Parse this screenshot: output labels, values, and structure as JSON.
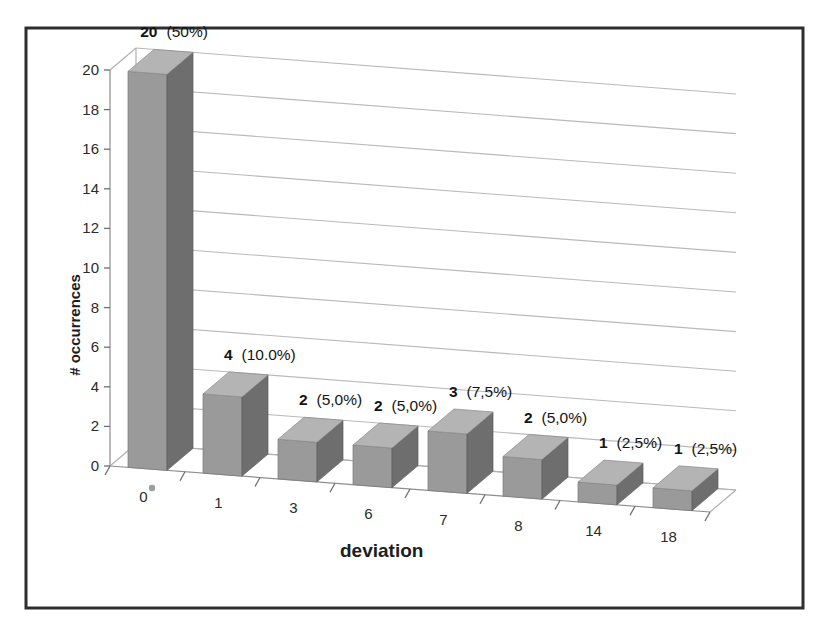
{
  "chart_data": {
    "type": "bar",
    "title": "",
    "subtitle": "",
    "xlabel": "deviation",
    "ylabel": "# occurrences",
    "categories": [
      "0",
      "1",
      "3",
      "6",
      "7",
      "8",
      "14",
      "18"
    ],
    "values": [
      20,
      4,
      2,
      2,
      3,
      2,
      1,
      1
    ],
    "data_labels": [
      "20  (50%)",
      "4 (10.0%)",
      "2 (5,0%)",
      "2 (5,0%)",
      "3 (7,5%)",
      "2 (5,0%)",
      "1 (2,5%)",
      "1 (2,5%)"
    ],
    "label_values": [
      "20",
      "4",
      "2",
      "2",
      "3",
      "2",
      "1",
      "1"
    ],
    "label_percents": [
      "(50%)",
      "(10.0%)",
      "(5,0%)",
      "(5,0%)",
      "(7,5%)",
      "(5,0%)",
      "(2,5%)",
      "(2,5%)"
    ],
    "percent_values": [
      50.0,
      10.0,
      5.0,
      5.0,
      7.5,
      5.0,
      2.5,
      2.5
    ],
    "ylim": [
      0,
      20
    ],
    "ytick_labels": [
      "0",
      "2",
      "4",
      "6",
      "8",
      "10",
      "12",
      "14",
      "16",
      "18",
      "20"
    ],
    "ytick_values": [
      0,
      2,
      4,
      6,
      8,
      10,
      12,
      14,
      16,
      18,
      20
    ],
    "grid": true,
    "legend": false,
    "legend_position": "none",
    "three_d": true,
    "total_occurrences": 40,
    "colors": {
      "bar_front": "#9a9a9a",
      "bar_side": "#6e6e6e",
      "bar_top": "#b4b4b4",
      "gridline": "#b9b9b9",
      "frame_border": "#2e2e2e",
      "text": "#1d1d1d",
      "background": "#ffffff"
    }
  }
}
